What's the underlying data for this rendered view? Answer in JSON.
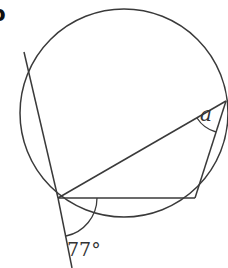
{
  "figure": {
    "part_label": "b",
    "angle_given": "77°",
    "angle_unknown": "a",
    "colors": {
      "line": "#3a3a3a",
      "text": "#333333",
      "background": "#ffffff"
    },
    "circle": {
      "cx": 124,
      "cy": 113,
      "r": 104
    },
    "points": {
      "P": [
        58,
        198
      ],
      "Q": [
        195,
        198
      ],
      "R": [
        226,
        101
      ],
      "T_top": [
        24,
        52
      ],
      "T_bottom": [
        72,
        268
      ]
    }
  }
}
